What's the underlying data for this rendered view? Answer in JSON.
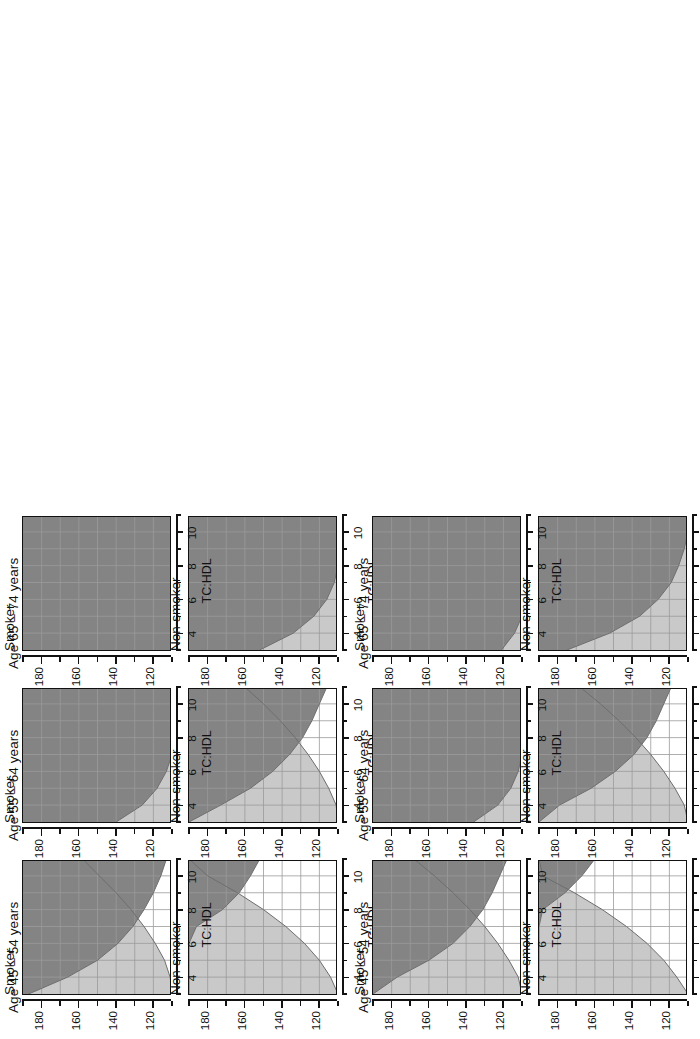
{
  "figure": {
    "kind": "cvd-risk-colour-chart",
    "orientation": "rotated-90-ccw",
    "panel_rows": 3,
    "panel_cols": 2,
    "groups": 2
  },
  "axes": {
    "x_label": "TC:HDL",
    "x_ticks": [
      "4",
      "6",
      "8",
      "10"
    ],
    "x_tick_values": [
      4,
      6,
      8,
      10
    ],
    "x_minor_values": [
      3,
      5,
      7,
      9,
      11
    ],
    "x_range": [
      3,
      11
    ],
    "y_label": "SBP",
    "y_ticks": [
      "180",
      "160",
      "140",
      "120"
    ],
    "y_tick_values": [
      180,
      160,
      140,
      120
    ],
    "y_minor_values": [
      190,
      170,
      150,
      130,
      110
    ],
    "y_range": [
      110,
      190
    ]
  },
  "age_groups": [
    {
      "id": "age-45-54",
      "title": "Age 45 – 54 years"
    },
    {
      "id": "age-55-64",
      "title": "Age 55 – 64 years"
    },
    {
      "id": "age-65-74",
      "title": "Age 65 – 74 years"
    }
  ],
  "smoking_status": [
    {
      "id": "non-smoker",
      "title": "Non-smoker"
    },
    {
      "id": "smoker",
      "title": "Smoker"
    }
  ],
  "colors": {
    "low_risk": "#ffffff",
    "moderate_risk": "#c9c9c9",
    "high_risk": "#848484",
    "grid": "#9a9a9a",
    "axis": "#111111",
    "contour": "#6e6e6e",
    "background": "#ffffff"
  },
  "chart_data": {
    "type": "heatmap",
    "xlabel": "TC:HDL",
    "ylabel": "SBP",
    "xlim": [
      3,
      11
    ],
    "ylim": [
      110,
      190
    ],
    "grid": true,
    "legend": "none",
    "bands": [
      {
        "name": "low",
        "fill": "#ffffff"
      },
      {
        "name": "moderate",
        "fill": "#c9c9c9"
      },
      {
        "name": "high",
        "fill": "#848484"
      }
    ],
    "panels": [
      {
        "group": 1,
        "age": "Age 45 – 54 years",
        "smoking": "Non-smoker",
        "boundary_low_moderate": {
          "x": [
            3,
            4,
            5,
            6,
            7,
            8,
            9,
            10,
            11
          ],
          "y": [
            110,
            114,
            120,
            128,
            138,
            150,
            164,
            180,
            190
          ]
        },
        "boundary_moderate_high": {
          "x": [
            3,
            4,
            5,
            6,
            7,
            8,
            9,
            10,
            11
          ],
          "y": [
            190,
            190,
            190,
            190,
            186,
            172,
            163,
            157,
            152
          ]
        },
        "area_fractions": {
          "low": 0.31,
          "moderate": 0.53,
          "high": 0.16
        }
      },
      {
        "group": 1,
        "age": "Age 45 – 54 years",
        "smoking": "Smoker",
        "boundary_low_moderate": {
          "x": [
            3,
            4,
            5,
            6,
            7,
            8,
            9,
            10,
            11
          ],
          "y": [
            110,
            111,
            114,
            119,
            125,
            132,
            140,
            149,
            158
          ]
        },
        "boundary_moderate_high": {
          "x": [
            3,
            4,
            5,
            6,
            7,
            8,
            9,
            10,
            11
          ],
          "y": [
            187,
            166,
            150,
            139,
            131,
            125,
            120,
            116,
            113
          ]
        },
        "area_fractions": {
          "low": 0.1,
          "moderate": 0.34,
          "high": 0.56
        }
      },
      {
        "group": 1,
        "age": "Age 55 – 64 years",
        "smoking": "Non-smoker",
        "boundary_low_moderate": {
          "x": [
            3,
            4,
            5,
            6,
            7,
            8,
            9,
            10,
            11
          ],
          "y": [
            110,
            111,
            115,
            120,
            126,
            133,
            141,
            150,
            160
          ]
        },
        "boundary_moderate_high": {
          "x": [
            3,
            4,
            5,
            6,
            7,
            8,
            9,
            10,
            11
          ],
          "y": [
            190,
            173,
            157,
            145,
            136,
            129,
            124,
            120,
            116
          ]
        },
        "area_fractions": {
          "low": 0.11,
          "moderate": 0.33,
          "high": 0.56
        }
      },
      {
        "group": 1,
        "age": "Age 55 – 64 years",
        "smoking": "Smoker",
        "boundary_low_moderate": {
          "x": [
            3,
            4,
            5,
            6,
            7,
            8,
            9,
            10,
            11
          ],
          "y": [
            110,
            110,
            110,
            110,
            110,
            110,
            110,
            110,
            110
          ]
        },
        "boundary_moderate_high": {
          "x": [
            3,
            4,
            5,
            6,
            7,
            8,
            9,
            10,
            11
          ],
          "y": [
            140,
            126,
            118,
            113,
            110,
            110,
            110,
            110,
            110
          ]
        },
        "area_fractions": {
          "low": 0.0,
          "moderate": 0.07,
          "high": 0.93
        }
      },
      {
        "group": 1,
        "age": "Age 65 – 74 years",
        "smoking": "Non-smoker",
        "boundary_low_moderate": {
          "x": [
            3,
            4,
            5,
            6,
            7,
            8,
            9,
            10,
            11
          ],
          "y": [
            110,
            110,
            110,
            110,
            110,
            110,
            110,
            110,
            110
          ]
        },
        "boundary_moderate_high": {
          "x": [
            3,
            4,
            5,
            6,
            7,
            8,
            9,
            10,
            11
          ],
          "y": [
            152,
            134,
            123,
            116,
            112,
            110,
            110,
            110,
            110
          ]
        },
        "area_fractions": {
          "low": 0.0,
          "moderate": 0.09,
          "high": 0.91
        }
      },
      {
        "group": 1,
        "age": "Age 65 – 74 years",
        "smoking": "Smoker",
        "boundary_low_moderate": {
          "x": [
            3,
            4,
            5,
            6,
            7,
            8,
            9,
            10,
            11
          ],
          "y": [
            110,
            110,
            110,
            110,
            110,
            110,
            110,
            110,
            110
          ]
        },
        "boundary_moderate_high": {
          "x": [
            3,
            4,
            5,
            6,
            7,
            8,
            9,
            10,
            11
          ],
          "y": [
            110,
            110,
            110,
            110,
            110,
            110,
            110,
            110,
            110
          ]
        },
        "area_fractions": {
          "low": 0.0,
          "moderate": 0.0,
          "high": 1.0
        }
      },
      {
        "group": 2,
        "age": "Age 45 – 54 years",
        "smoking": "Non-smoker",
        "boundary_low_moderate": {
          "x": [
            3,
            4,
            5,
            6,
            7,
            8,
            9,
            10,
            11
          ],
          "y": [
            110,
            116,
            123,
            132,
            143,
            156,
            171,
            188,
            190
          ]
        },
        "boundary_moderate_high": {
          "x": [
            3,
            4,
            5,
            6,
            7,
            8,
            9,
            10,
            11
          ],
          "y": [
            190,
            190,
            190,
            190,
            190,
            188,
            176,
            167,
            160
          ]
        },
        "area_fractions": {
          "low": 0.36,
          "moderate": 0.52,
          "high": 0.12
        }
      },
      {
        "group": 2,
        "age": "Age 45 – 54 years",
        "smoking": "Smoker",
        "boundary_low_moderate": {
          "x": [
            3,
            4,
            5,
            6,
            7,
            8,
            9,
            10,
            11
          ],
          "y": [
            110,
            112,
            117,
            123,
            130,
            138,
            147,
            157,
            168
          ]
        },
        "boundary_moderate_high": {
          "x": [
            3,
            4,
            5,
            6,
            7,
            8,
            9,
            10,
            11
          ],
          "y": [
            190,
            177,
            160,
            147,
            138,
            131,
            126,
            122,
            118
          ]
        },
        "area_fractions": {
          "low": 0.13,
          "moderate": 0.36,
          "high": 0.51
        }
      },
      {
        "group": 2,
        "age": "Age 55 – 64 years",
        "smoking": "Non-smoker",
        "boundary_low_moderate": {
          "x": [
            3,
            4,
            5,
            6,
            7,
            8,
            9,
            10,
            11
          ],
          "y": [
            110,
            112,
            117,
            123,
            130,
            138,
            147,
            157,
            168
          ]
        },
        "boundary_moderate_high": {
          "x": [
            3,
            4,
            5,
            6,
            7,
            8,
            9,
            10,
            11
          ],
          "y": [
            190,
            179,
            162,
            149,
            139,
            132,
            127,
            123,
            119
          ]
        },
        "area_fractions": {
          "low": 0.13,
          "moderate": 0.36,
          "high": 0.51
        }
      },
      {
        "group": 2,
        "age": "Age 55 – 64 years",
        "smoking": "Smoker",
        "boundary_low_moderate": {
          "x": [
            3,
            4,
            5,
            6,
            7,
            8,
            9,
            10,
            11
          ],
          "y": [
            110,
            110,
            110,
            110,
            110,
            110,
            110,
            110,
            110
          ]
        },
        "boundary_moderate_high": {
          "x": [
            3,
            4,
            5,
            6,
            7,
            8,
            9,
            10,
            11
          ],
          "y": [
            136,
            123,
            116,
            112,
            110,
            110,
            110,
            110,
            110
          ]
        },
        "area_fractions": {
          "low": 0.0,
          "moderate": 0.06,
          "high": 0.94
        }
      },
      {
        "group": 2,
        "age": "Age 65 – 74 years",
        "smoking": "Non-smoker",
        "boundary_low_moderate": {
          "x": [
            3,
            4,
            5,
            6,
            7,
            8,
            9,
            10,
            11
          ],
          "y": [
            110,
            110,
            110,
            110,
            110,
            110,
            110,
            110,
            110
          ]
        },
        "boundary_moderate_high": {
          "x": [
            3,
            4,
            5,
            6,
            7,
            8,
            9,
            10,
            11
          ],
          "y": [
            175,
            152,
            136,
            126,
            119,
            115,
            112,
            110,
            110
          ]
        },
        "area_fractions": {
          "low": 0.0,
          "moderate": 0.15,
          "high": 0.85
        }
      },
      {
        "group": 2,
        "age": "Age 65 – 74 years",
        "smoking": "Smoker",
        "boundary_low_moderate": {
          "x": [
            3,
            4,
            5,
            6,
            7,
            8,
            9,
            10,
            11
          ],
          "y": [
            110,
            110,
            110,
            110,
            110,
            110,
            110,
            110,
            110
          ]
        },
        "boundary_moderate_high": {
          "x": [
            3,
            4,
            5,
            6,
            7,
            8,
            9,
            10,
            11
          ],
          "y": [
            121,
            114,
            110,
            110,
            110,
            110,
            110,
            110,
            110
          ]
        },
        "area_fractions": {
          "low": 0.0,
          "moderate": 0.02,
          "high": 0.98
        }
      }
    ]
  }
}
